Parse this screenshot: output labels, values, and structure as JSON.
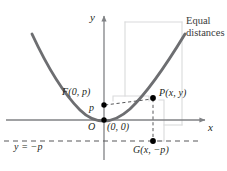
{
  "figure": {
    "type": "parabola-focus-directrix-diagram",
    "axes": {
      "x_label": "x",
      "y_label": "y"
    },
    "labels": {
      "focus": "F(0, p)",
      "focal_distance": "p",
      "origin_point": "O",
      "origin_coords": "(0, 0)",
      "point_p": "P(x, y)",
      "point_g": "G(x, −p)",
      "directrix": "y = −p",
      "note_line1": "Equal",
      "note_line2": "distances"
    },
    "colors": {
      "curve": "#6d6e71",
      "axis": "#808285",
      "dashed": "#58595b",
      "leader": "#d9dadb",
      "text": "#231f20",
      "note_text": "#3b3b3b",
      "dot": "#000000"
    },
    "geometry": {
      "origin": [
        104,
        120
      ],
      "focus": [
        104,
        105
      ],
      "point_p": [
        153,
        98
      ],
      "point_g": [
        153,
        141
      ],
      "directrix_y": 141,
      "x_axis_y": 120,
      "y_axis_x": 104
    }
  }
}
